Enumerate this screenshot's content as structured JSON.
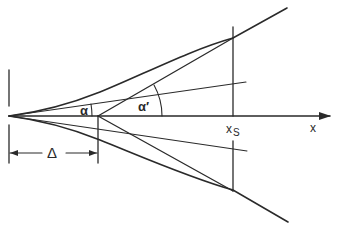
{
  "diagram": {
    "type": "geometric-schematic",
    "labels": {
      "alpha": "α",
      "alpha_prime": "α′",
      "delta": "Δ",
      "x_s_base": "x",
      "x_s_sub": "S",
      "x_axis": "x"
    },
    "colors": {
      "ink": "#2a2a2a",
      "background": "#ffffff"
    },
    "elements": [
      "x-axis with arrow",
      "upper boundary curve",
      "lower boundary curve",
      "tangent line from Δ point (upper)",
      "tangent line from Δ point (lower)",
      "thin ray from origin (upper)",
      "thin ray from origin (lower)",
      "vertical reference at origin",
      "vertical reference at Δ",
      "vertical station line at x_S",
      "Δ dimension arrow",
      "angle arc α",
      "angle arc α′"
    ]
  }
}
